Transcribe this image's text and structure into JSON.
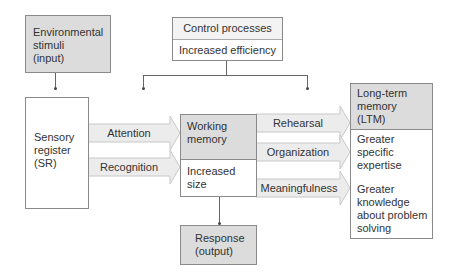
{
  "diagram": {
    "environmental": {
      "line1": "Environmental",
      "line2": "stimuli",
      "line3": "(input)"
    },
    "control": {
      "title": "Control processes",
      "subtitle": "Increased efficiency"
    },
    "sensory": {
      "line1": "Sensory",
      "line2": "register",
      "line3": "(SR)"
    },
    "working": {
      "line1": "Working",
      "line2": "memory",
      "sub1": "Increased",
      "sub2": "size"
    },
    "response": {
      "line1": "Response",
      "line2": "(output)"
    },
    "ltm": {
      "line1": "Long-term",
      "line2": "memory",
      "line3": "(LTM)",
      "expertise1": "Greater",
      "expertise2": "specific",
      "expertise3": "expertise",
      "knowledge1": "Greater",
      "knowledge2": "knowledge",
      "knowledge3": "about problem",
      "knowledge4": "solving"
    },
    "arrows": {
      "attention": "Attention",
      "recognition": "Recognition",
      "rehearsal": "Rehearsal",
      "organization": "Organization",
      "meaningfulness": "Meaningfulness"
    },
    "colors": {
      "shaded_fill": "#dcdcdc",
      "border": "#8a8a8a",
      "arrow_fill": "#ececec"
    }
  }
}
